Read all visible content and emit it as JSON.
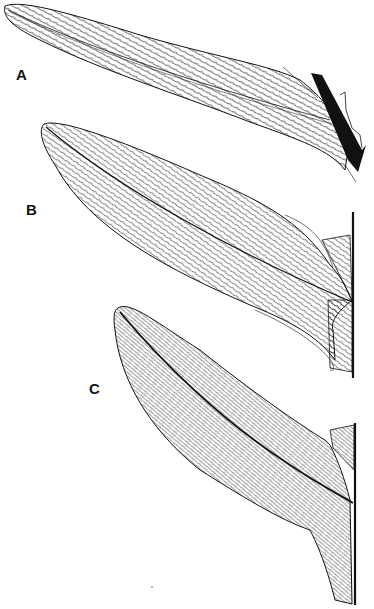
{
  "figure": {
    "type": "botanical line drawing",
    "panels": [
      {
        "label": "A",
        "label_pos": [
          20,
          68
        ]
      },
      {
        "label": "B",
        "label_pos": [
          27,
          198
        ]
      },
      {
        "label": "C",
        "label_pos": [
          90,
          380
        ]
      }
    ],
    "colors": {
      "ink": "#111111",
      "background": "#ffffff"
    }
  }
}
